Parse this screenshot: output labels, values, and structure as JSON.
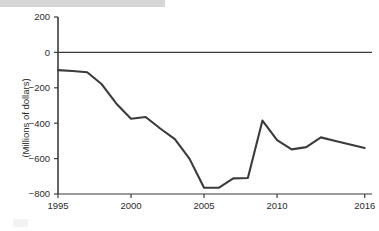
{
  "chart_data": {
    "type": "line",
    "title": "",
    "xlabel": "",
    "ylabel": "(Millions of dollars)",
    "units": "Millions of dollars",
    "x": [
      1995,
      1996,
      1997,
      1998,
      1999,
      2000,
      2001,
      2002,
      2003,
      2004,
      2005,
      2006,
      2007,
      2008,
      2009,
      2010,
      2011,
      2012,
      2013,
      2014,
      2015,
      2016
    ],
    "values": [
      -100,
      -105,
      -112,
      -180,
      -290,
      -375,
      -365,
      -430,
      -490,
      -600,
      -765,
      -765,
      -712,
      -710,
      -385,
      -495,
      -548,
      -535,
      -480,
      -500,
      -520,
      -540
    ],
    "series": [
      {
        "name": "Balance",
        "values": [
          -100,
          -105,
          -112,
          -180,
          -290,
          -375,
          -365,
          -430,
          -490,
          -600,
          -765,
          -765,
          -712,
          -710,
          -385,
          -495,
          -548,
          -535,
          -480,
          -500,
          -520,
          -540
        ]
      }
    ],
    "xlim": [
      1995,
      2016.5
    ],
    "ylim": [
      -800,
      200
    ],
    "y_ticks": [
      200,
      0,
      -200,
      -400,
      -600,
      -800
    ],
    "y_tick_labels": [
      "200",
      "0",
      "−200",
      "−400",
      "−600",
      "−800"
    ],
    "x_ticks": [
      1995,
      2000,
      2005,
      2010,
      2016
    ],
    "x_tick_labels": [
      "1995",
      "2000",
      "2005",
      "2010",
      "2016"
    ],
    "grid": false,
    "legend": "none",
    "zero_line": true,
    "line_color": "#3b3b3b",
    "axis_color": "#3b3b3b"
  },
  "axes": {
    "y_title": "(Millions of dollars)"
  },
  "decor": {
    "banner_color": "#d6d6d6"
  }
}
